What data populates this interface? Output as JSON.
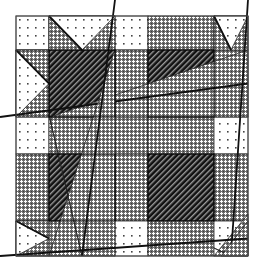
{
  "title": "Star quilt block pattern",
  "grid": {
    "x": [
      16,
      49,
      115,
      148,
      214,
      248
    ],
    "y": [
      16,
      50,
      117,
      154,
      221,
      256
    ]
  },
  "fabrics": {
    "dotted": {
      "background": "#ffffff",
      "dot": "#444444",
      "label": "white dotted"
    },
    "crosshatch": {
      "background": "#6e6e6e",
      "dot": "#ffffff",
      "label": "gray crosshatch"
    },
    "stripe": {
      "background": "#111111",
      "stripe": "#9a9a9a",
      "label": "dark diagonal stripe"
    }
  },
  "outline_color": "#222222",
  "stars": [
    {
      "name": "top-left",
      "col": 0,
      "row": 0,
      "geese": [
        "top",
        "left"
      ]
    },
    {
      "name": "top-right",
      "col": 3,
      "row": 0,
      "geese": [
        "top",
        "right"
      ]
    },
    {
      "name": "bottom-left",
      "col": 0,
      "row": 3,
      "geese": [
        "bottom",
        "left"
      ]
    },
    {
      "name": "bottom-right",
      "col": 3,
      "row": 3,
      "geese": [
        "bottom",
        "right"
      ]
    }
  ]
}
